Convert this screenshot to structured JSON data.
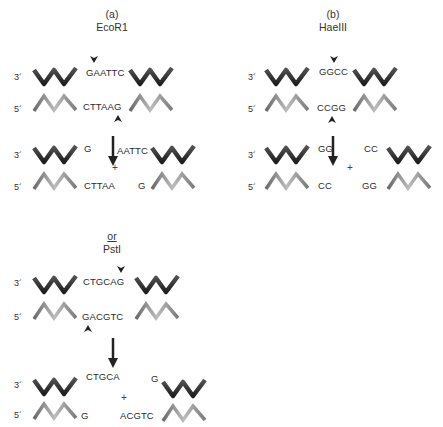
{
  "panel_a": {
    "label": "(a)",
    "enzyme": "EcoR1",
    "uncut": {
      "top_seq": "GAATTC",
      "bottom_seq": "CTTAAG"
    },
    "cut": {
      "top_left": "G",
      "top_right": "AATTC",
      "bottom_left": "CTTAA",
      "bottom_right": "G",
      "plus": "+"
    },
    "alt_conj": "or",
    "alt_enzyme": "PstI",
    "alt_uncut": {
      "top_seq": "CTGCAG",
      "bottom_seq": "GACGTC"
    },
    "alt_cut": {
      "top_left": "CTGCA",
      "top_right": "G",
      "bottom_left": "G",
      "bottom_right": "ACGTC",
      "plus": "+"
    }
  },
  "panel_b": {
    "label": "(b)",
    "enzyme": "HaeIII",
    "uncut": {
      "top_seq": "GGCC",
      "bottom_seq": "CCGG"
    },
    "cut": {
      "top_left": "GG",
      "top_right": "CC",
      "bottom_left": "CC",
      "bottom_right": "GG",
      "plus": "+"
    }
  },
  "ends": {
    "three_prime": "3´",
    "five_prime": "5´"
  },
  "colors": {
    "top_strand": "#2e2e2e",
    "bottom_strand": "#8a8a8a",
    "arrow": "#222222"
  }
}
